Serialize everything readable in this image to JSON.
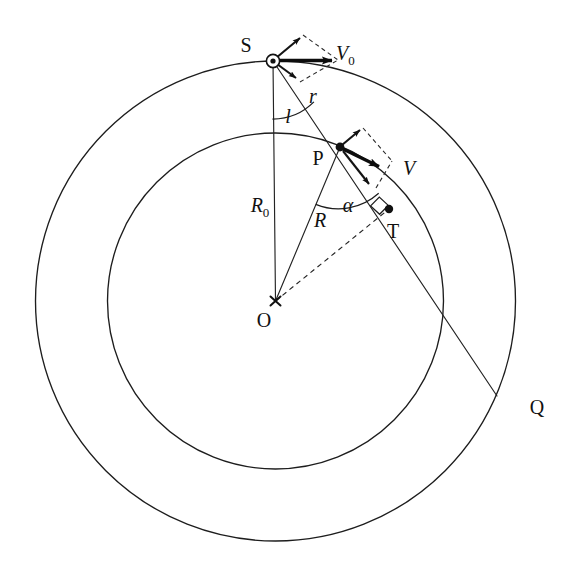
{
  "figure": {
    "background_color": "#ffffff",
    "line_color": "#1d1d1d",
    "width": 579,
    "height": 575
  },
  "labels": {
    "source_point": "S",
    "orbit_point": "P",
    "tangent_point": "T",
    "center_point": "O",
    "far_point": "Q",
    "initial_velocity": "V",
    "initial_velocity_subscript": "0",
    "velocity": "V",
    "outer_radius": "R",
    "outer_radius_subscript": "0",
    "inner_radius": "R",
    "chord": "r",
    "angle_l": "l",
    "angle_alpha": "α"
  },
  "geometry": {
    "center": {
      "x": 275.5,
      "y": 301
    },
    "outer_circle_radius": 240,
    "inner_circle_radius": 168,
    "point_S": {
      "x": 273,
      "y": 61
    },
    "point_P": {
      "x": 340,
      "y": 147
    },
    "point_T": {
      "x": 389,
      "y": 209
    },
    "point_Q": {
      "x": 497,
      "y": 396
    },
    "vector_V0_end": {
      "x": 338,
      "y": 60
    },
    "vector_V_end": {
      "x": 385,
      "y": 168
    }
  },
  "elements": {
    "outer_circle": "outer-orbit-circle",
    "inner_circle": "inner-orbit-circle",
    "line_SO": "radius-line-R0",
    "line_SQ": "chord-line-SQ",
    "line_PO": "radius-line-R",
    "line_OT": "dashed-line-OT",
    "angle_arc_l": "angle-arc-l",
    "angle_arc_alpha": "angle-arc-alpha",
    "right_angle_marker": "right-angle-marker-T"
  }
}
